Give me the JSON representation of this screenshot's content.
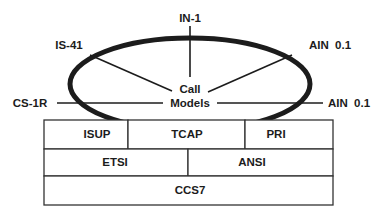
{
  "diagram": {
    "hub": {
      "line1": "Call",
      "line2": "Models"
    },
    "ring_labels": {
      "top": "IN-1",
      "upper_left": "IS-41",
      "upper_right": "AIN  0.1",
      "left": "CS-1R",
      "right": "AIN  0.1"
    },
    "stack": {
      "row1": [
        "ISUP",
        "TCAP",
        "PRI"
      ],
      "row2": [
        "ETSI",
        "ANSI"
      ],
      "row3": [
        "CCS7"
      ]
    },
    "colors": {
      "ink": "#1c1c1c",
      "background": "#ffffff"
    }
  }
}
